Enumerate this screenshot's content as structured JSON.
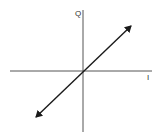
{
  "diagram": {
    "type": "iq-constellation-axes",
    "axes": {
      "vertical_label": "Q",
      "horizontal_label": "I"
    },
    "trace": {
      "description": "double-headed straight line through origin",
      "from": [
        36,
        117
      ],
      "to": [
        131,
        26
      ],
      "origin": [
        83,
        71
      ]
    },
    "colors": {
      "axis": "#555555",
      "trace": "#1a1a1a",
      "label": "#333333",
      "background": "#ffffff"
    }
  }
}
